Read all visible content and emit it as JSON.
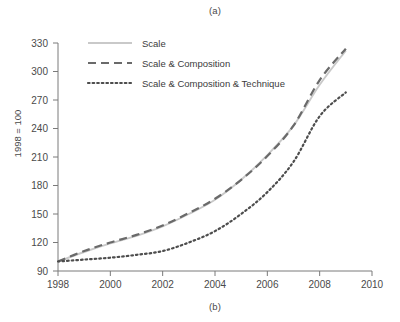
{
  "figure": {
    "caption_top": "(a)",
    "caption_bottom": "(b)",
    "ylabel": "1998 = 100"
  },
  "chart_data": {
    "type": "line",
    "title": "",
    "xlabel": "",
    "ylabel": "1998 = 100",
    "xlim": [
      1998,
      2010
    ],
    "ylim": [
      90,
      330
    ],
    "xticks": [
      1998,
      2000,
      2002,
      2004,
      2006,
      2008,
      2010
    ],
    "yticks": [
      90,
      120,
      150,
      180,
      210,
      240,
      270,
      300,
      330
    ],
    "xtick_labels": [
      "1998",
      "2000",
      "2002",
      "2004",
      "2006",
      "2008",
      "2010"
    ],
    "ytick_labels": [
      "90",
      "120",
      "150",
      "180",
      "210",
      "240",
      "270",
      "300",
      "330"
    ],
    "grid": false,
    "legend_position": "top-left",
    "x": [
      1998,
      1999,
      2000,
      2001,
      2002,
      2003,
      2004,
      2005,
      2006,
      2007,
      2008,
      2009
    ],
    "series": [
      {
        "name": "Scale",
        "style": "solid",
        "color": "#c9c9c9",
        "values": [
          100,
          110,
          119,
          127,
          137,
          150,
          165,
          186,
          212,
          243,
          286,
          322
        ]
      },
      {
        "name": "Scale & Composition",
        "style": "dashed",
        "color": "#6a6a6a",
        "values": [
          100,
          111,
          120,
          128,
          138,
          151,
          166,
          186,
          211,
          243,
          291,
          324
        ]
      },
      {
        "name": "Scale & Composition & Technique",
        "style": "dotted",
        "color": "#4d4d4d",
        "values": [
          100,
          102,
          104,
          107,
          111,
          120,
          132,
          150,
          173,
          205,
          253,
          278
        ]
      }
    ]
  },
  "legend": {
    "items": [
      {
        "label": "Scale"
      },
      {
        "label": "Scale & Composition"
      },
      {
        "label": "Scale & Composition & Technique"
      }
    ]
  }
}
